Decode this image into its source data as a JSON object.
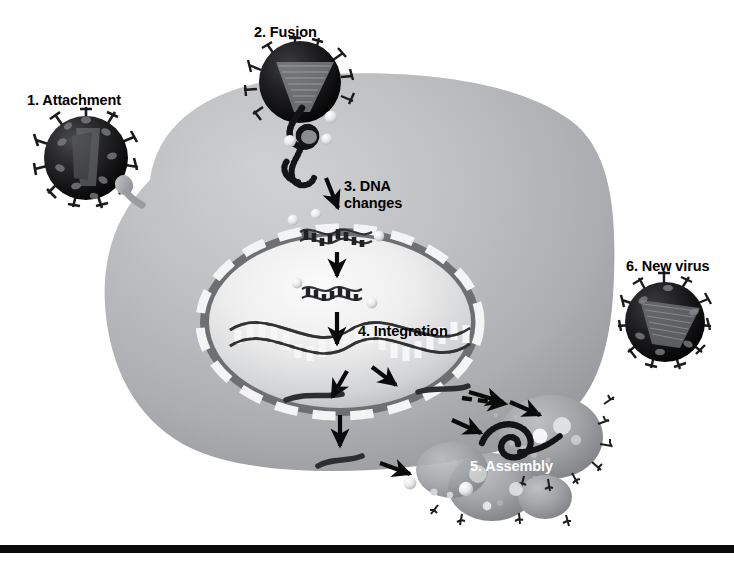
{
  "figure": {
    "background_color": "#ffffff",
    "rule_color": "#0a0a0a",
    "cell_color_light": "#cfd1d2",
    "cell_color_mid": "#a7a9ac",
    "cell_color_dark": "#85878a",
    "nucleus_color_light": "#f2f2f2",
    "nucleus_membrane_dark": "#6d6f72",
    "virus_color": "#1a1a1a",
    "label_color": "#000000",
    "label_color_alt": "#ffffff"
  },
  "labels": {
    "attachment": "1. Attachment",
    "fusion": "2. Fusion",
    "dna_changes": "3. DNA\nchanges",
    "integration": "4. Integration",
    "assembly": "5. Assembly",
    "new_virus": "6. New virus"
  },
  "steps": [
    {
      "number": "1",
      "name": "Attachment",
      "label": "1. Attachment",
      "text_color": "#000000"
    },
    {
      "number": "2",
      "name": "Fusion",
      "label": "2. Fusion",
      "text_color": "#000000"
    },
    {
      "number": "3",
      "name": "DNA changes",
      "label": "3. DNA changes",
      "text_color": "#000000"
    },
    {
      "number": "4",
      "name": "Integration",
      "label": "4. Integration",
      "text_color": "#000000"
    },
    {
      "number": "5",
      "name": "Assembly",
      "label": "5. Assembly",
      "text_color": "#ffffff"
    },
    {
      "number": "6",
      "name": "New virus",
      "label": "6. New virus",
      "text_color": "#000000"
    }
  ]
}
